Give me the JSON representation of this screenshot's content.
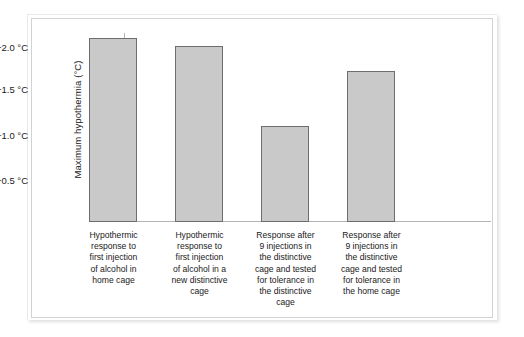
{
  "chart_data": {
    "type": "bar",
    "title": "",
    "xlabel": "",
    "ylabel": "Maximum hypothermia (°C)",
    "categories": [
      "Hypothermic response to first injection of alcohol in home cage",
      "Hypothermic response to first injection of alcohol in a new distinctive cage",
      "Response after 9 injections in the distinctive cage and tested for tolerance in the distinctive cage",
      "Response after 9 injections in the distinctive cage and tested for tolerance in the home cage"
    ],
    "category_lines": [
      [
        "Hypothermic",
        "response to",
        "first injection",
        "of alcohol in",
        "home cage"
      ],
      [
        "Hypothermic",
        "response to",
        "first injection",
        "of alcohol in a",
        "new distinctive",
        "cage"
      ],
      [
        "Response after",
        "9 injections in",
        "the distinctive",
        "cage and tested",
        "for tolerance in",
        "the distinctive",
        "cage"
      ],
      [
        "Response after",
        "9 injections in",
        "the distinctive",
        "cage and tested",
        "for tolerance in",
        "the home cage"
      ]
    ],
    "values": [
      -2.1,
      -2.0,
      -1.1,
      -1.75
    ],
    "ylim": [
      0,
      -2.25
    ],
    "y_ticks": [
      -2.0,
      -1.5,
      -1.0,
      -0.5
    ],
    "y_tick_labels": [
      "−2.0 °C",
      "−1.5 °C",
      "−1.0 °C",
      "−0.5 °C"
    ],
    "y_axis_inverted": true,
    "grid": false,
    "legend": null,
    "bar_fill_color": "#c9c9c9",
    "bar_border_color": "#6e6e6e",
    "axis_color": "#b4b4b4",
    "background_color": "#ffffff"
  },
  "geometry": {
    "bars": [
      {
        "left": 57,
        "width": 48,
        "top": 19,
        "height": 184
      },
      {
        "left": 143,
        "width": 48,
        "top": 27,
        "height": 176
      },
      {
        "left": 229,
        "width": 48,
        "top": 107,
        "height": 96
      },
      {
        "left": 315,
        "width": 48,
        "top": 52,
        "height": 151
      }
    ],
    "ticks": [
      {
        "top": 29
      },
      {
        "top": 71
      },
      {
        "top": 117
      },
      {
        "top": 162
      }
    ],
    "labels": [
      {
        "left": 48,
        "width": 67
      },
      {
        "left": 134,
        "width": 67
      },
      {
        "left": 218,
        "width": 71
      },
      {
        "left": 304,
        "width": 71
      }
    ]
  }
}
